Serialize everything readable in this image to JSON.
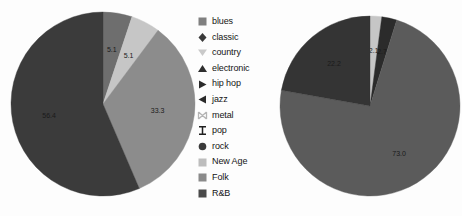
{
  "figure": {
    "background_color": "#fdfdfd",
    "label_text_color": "#1a1a1a"
  },
  "legend": {
    "position": "center",
    "items": [
      {
        "label": "blues",
        "marker": "square-icon",
        "color": "#808080"
      },
      {
        "label": "classic",
        "marker": "diamond-icon",
        "color": "#3a3a3a"
      },
      {
        "label": "country",
        "marker": "triangle-down-icon",
        "color": "#c9c9c9"
      },
      {
        "label": "electronic",
        "marker": "triangle-up-icon",
        "color": "#2e2e2e"
      },
      {
        "label": "hip hop",
        "marker": "triangle-right-icon",
        "color": "#2a2a2a"
      },
      {
        "label": "jazz",
        "marker": "triangle-left-icon",
        "color": "#2a2a2a"
      },
      {
        "label": "metal",
        "marker": "hourglass-h-icon",
        "color": "#b4b4b4"
      },
      {
        "label": "pop",
        "marker": "i-bar-icon",
        "color": "#1f1f1f"
      },
      {
        "label": "rock",
        "marker": "circle-icon",
        "color": "#3a3a3a"
      },
      {
        "label": "New Age",
        "marker": "square-icon",
        "color": "#bdbdbd"
      },
      {
        "label": "Folk",
        "marker": "square-icon",
        "color": "#8a8a8a"
      },
      {
        "label": "R&B",
        "marker": "square-icon",
        "color": "#4a4a4a"
      }
    ]
  },
  "chart_data": [
    {
      "type": "pie",
      "name": "pie-left",
      "title": "",
      "start_angle": 90,
      "direction": "clockwise",
      "categories": [
        "blues",
        "New Age",
        "Folk",
        "R&B"
      ],
      "labels": [
        "5.1",
        "5.1",
        "33.3",
        "56.4"
      ],
      "values": [
        5.1,
        5.1,
        33.3,
        56.4
      ],
      "colors": [
        "#6e6e6e",
        "#c6c6c6",
        "#8c8c8c",
        "#3b3b3b"
      ]
    },
    {
      "type": "pie",
      "name": "pie-right",
      "title": "",
      "start_angle": 90,
      "direction": "clockwise",
      "categories": [
        "New Age",
        "blues",
        "Folk",
        "R&B"
      ],
      "labels": [
        "2.1",
        "2.7",
        "73.0",
        "22.2"
      ],
      "values": [
        2.1,
        2.7,
        73.0,
        22.2
      ],
      "colors": [
        "#c6c6c6",
        "#2b2b2b",
        "#5b5b5b",
        "#343434"
      ]
    }
  ]
}
